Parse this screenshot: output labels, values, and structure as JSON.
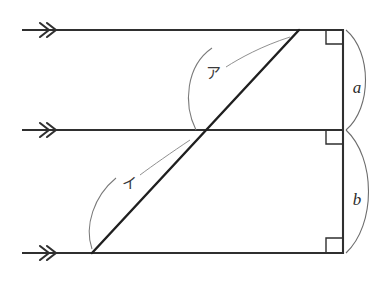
{
  "figure": {
    "title": "",
    "background_color": "#ffffff",
    "ink_color": "#2f2f2f",
    "thin_ink_color": "#6d6d6d",
    "width": 389,
    "height": 284
  },
  "labels": {
    "side_a": "a",
    "side_b": "b",
    "angle_upper": "ア",
    "angle_lower": "イ"
  },
  "icons": {
    "arrowhead_upper": "double-chevron-right-icon",
    "arrowhead_middle": "double-chevron-right-icon",
    "arrowhead_lower": "double-chevron-right-icon",
    "right_angle_top": "right-angle-marker-icon",
    "right_angle_middle": "right-angle-marker-icon",
    "right_angle_bottom": "right-angle-marker-icon"
  },
  "geometry": {
    "parallel_lines": [
      {
        "name": "upper-ray",
        "x1": 22,
        "y1": 30,
        "x2": 343,
        "y2": 30
      },
      {
        "name": "middle-ray",
        "x1": 22,
        "y1": 130,
        "x2": 343,
        "y2": 130
      },
      {
        "name": "lower-ray",
        "x1": 22,
        "y1": 253,
        "x2": 343,
        "y2": 253
      }
    ],
    "vertical_line": {
      "name": "right-vertical",
      "x1": 343,
      "y1": 29,
      "x2": 343,
      "y2": 254
    },
    "transversal": {
      "name": "diagonal-transversal",
      "x1": 92,
      "y1": 253,
      "x2": 299,
      "y2": 30
    },
    "intersection_point": {
      "x": 196,
      "y": 130
    },
    "segment_a": {
      "from_y": 30,
      "to_y": 130
    },
    "segment_b": {
      "from_y": 130,
      "to_y": 253
    }
  }
}
